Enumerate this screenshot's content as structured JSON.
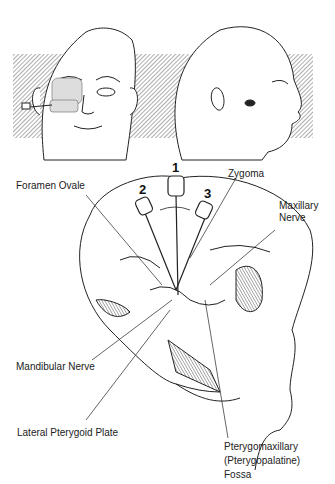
{
  "figure": {
    "type": "anatomical illustration",
    "panels": [
      "frontal-face-view",
      "lateral-head-view",
      "lateral-skull-cutaway"
    ]
  },
  "needle_positions": [
    "1",
    "2",
    "3"
  ],
  "labels": {
    "foramen_ovale": "Foramen Ovale",
    "zygoma": "Zygoma",
    "maxillary_nerve_line1": "Maxillary",
    "maxillary_nerve_line2": "Nerve",
    "mandibular_nerve": "Mandibular Nerve",
    "lateral_pterygoid_plate": "Lateral Pterygoid Plate",
    "fossa_line1": "Pterygomaxillary",
    "fossa_line2": "(Pterygopalatine)",
    "fossa_line3": "Fossa"
  },
  "colors": {
    "line": "#222222",
    "hatch": "#9a9a9a",
    "background": "#ffffff"
  }
}
